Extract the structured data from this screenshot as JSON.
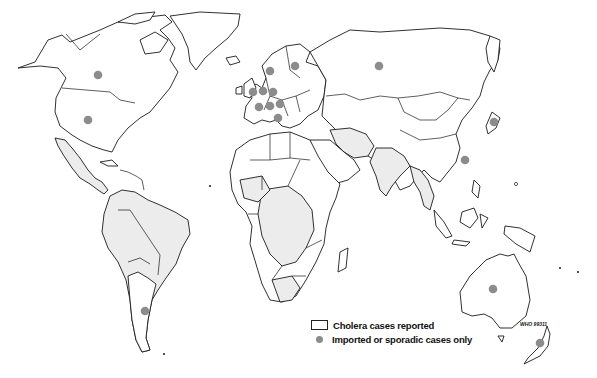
{
  "map": {
    "type": "world choropleth with point markers",
    "colors": {
      "affected_fill": "#ececec",
      "unaffected_fill": "#ffffff",
      "outline": "#1a1a1a",
      "marker": "#8c8c8c"
    },
    "affected_regions": [
      "Mexico",
      "Central America",
      "South America (Peru, Colombia, Venezuela, Brazil, Bolivia, Ecuador)",
      "West Africa",
      "Central Africa",
      "East Africa",
      "Southern Africa",
      "Iran",
      "Afghanistan",
      "India",
      "Myanmar",
      "Southeast Asia"
    ],
    "markers": [
      {
        "region": "Canada",
        "x": 98,
        "y": 75
      },
      {
        "region": "United States",
        "x": 88,
        "y": 120
      },
      {
        "region": "Norway",
        "x": 270,
        "y": 71
      },
      {
        "region": "Finland",
        "x": 295,
        "y": 66
      },
      {
        "region": "United Kingdom",
        "x": 253,
        "y": 92
      },
      {
        "region": "Netherlands",
        "x": 263,
        "y": 91
      },
      {
        "region": "Germany",
        "x": 273,
        "y": 92
      },
      {
        "region": "France",
        "x": 259,
        "y": 107
      },
      {
        "region": "Switzerland",
        "x": 270,
        "y": 106
      },
      {
        "region": "Austria",
        "x": 280,
        "y": 104
      },
      {
        "region": "Italy",
        "x": 278,
        "y": 118
      },
      {
        "region": "Russia",
        "x": 379,
        "y": 66
      },
      {
        "region": "Japan",
        "x": 494,
        "y": 122
      },
      {
        "region": "Hong Kong",
        "x": 465,
        "y": 160
      },
      {
        "region": "Argentina",
        "x": 145,
        "y": 311
      },
      {
        "region": "Australia",
        "x": 493,
        "y": 289
      },
      {
        "region": "New Zealand",
        "x": 540,
        "y": 343
      }
    ]
  },
  "legend": {
    "items": [
      {
        "swatch": "outline-box",
        "label": "Cholera cases reported"
      },
      {
        "swatch": "grey-dot",
        "label": "Imported or sporadic cases only"
      }
    ]
  },
  "reference_label": "WHO 99311"
}
